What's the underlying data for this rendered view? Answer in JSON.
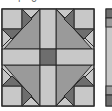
{
  "caption": "i  o",
  "block": {
    "name": "quilt-block",
    "colors": {
      "light": "#c8c8c8",
      "medium": "#9a9a9a",
      "dark": "#6e6e6e",
      "outline": "#2a2a2a",
      "background": "#ffffff"
    }
  },
  "neighbor_strip": {
    "name": "adjacent-block-edge"
  }
}
